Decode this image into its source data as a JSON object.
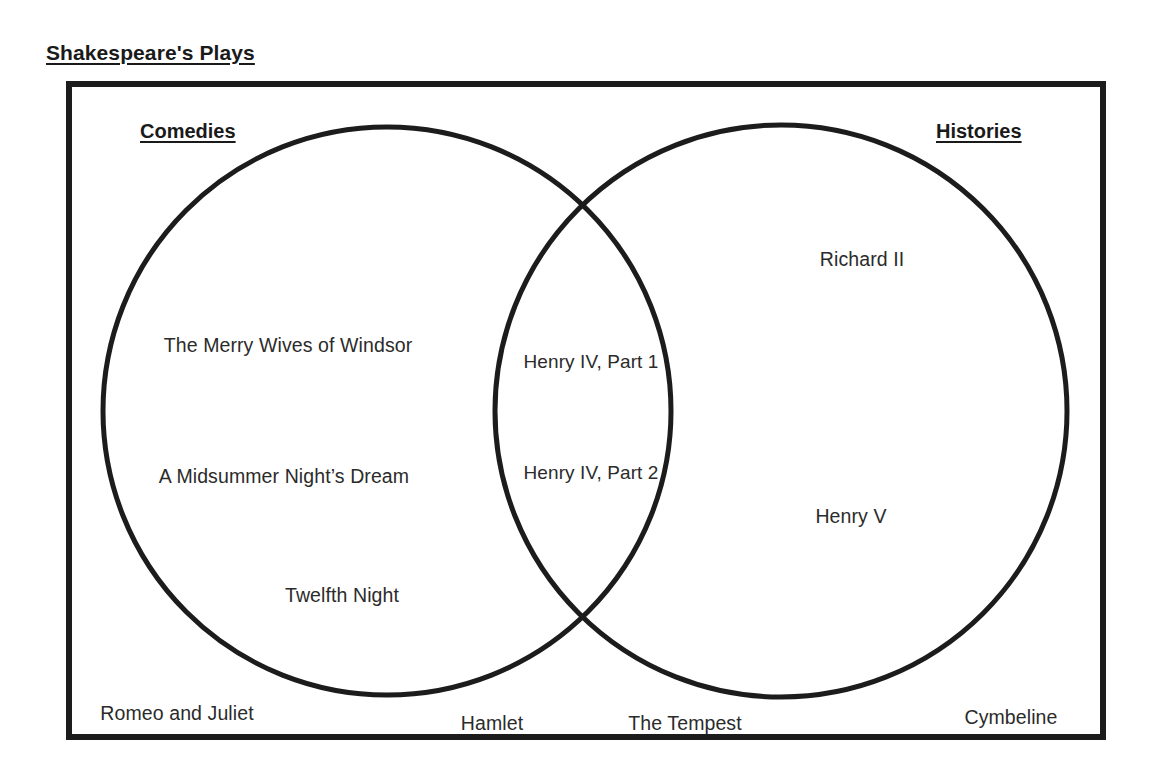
{
  "title": "Shakespeare's Plays",
  "diagram": {
    "type": "venn",
    "universe_label": "Shakespeare's Plays",
    "sets": [
      {
        "id": "comedies",
        "label": "Comedies"
      },
      {
        "id": "histories",
        "label": "Histories"
      }
    ],
    "captions": {
      "left": "Comedies",
      "right": "Histories"
    },
    "colors": {
      "stroke": "#1c1c1c",
      "text": "#2b2b2b",
      "heading": "#1a1a1a",
      "background": "#ffffff"
    },
    "regions": {
      "left_only": [
        "The Merry Wives of Windsor",
        "A Midsummer Night’s Dream",
        "Twelfth Night"
      ],
      "intersection": [
        "Henry IV, Part 1",
        "Henry IV, Part 2"
      ],
      "right_only": [
        "Richard II",
        "Henry V"
      ],
      "outside": [
        "Romeo and Juliet",
        "Hamlet",
        "The Tempest",
        "Cymbeline"
      ]
    },
    "items": [
      {
        "text": "The Merry Wives of Windsor",
        "region": "left_only",
        "x": 288,
        "y": 334
      },
      {
        "text": "A Midsummer Night’s Dream",
        "region": "left_only",
        "x": 284,
        "y": 465
      },
      {
        "text": "Twelfth Night",
        "region": "left_only",
        "x": 342,
        "y": 584
      },
      {
        "text": "Henry IV, Part 1",
        "region": "intersection",
        "x": 591,
        "y": 351
      },
      {
        "text": "Henry IV, Part 2",
        "region": "intersection",
        "x": 591,
        "y": 462
      },
      {
        "text": "Richard II",
        "region": "right_only",
        "x": 862,
        "y": 248
      },
      {
        "text": "Henry V",
        "region": "right_only",
        "x": 851,
        "y": 505
      },
      {
        "text": "Romeo and Juliet",
        "region": "outside",
        "x": 177,
        "y": 702
      },
      {
        "text": "Hamlet",
        "region": "outside",
        "x": 492,
        "y": 712
      },
      {
        "text": "The Tempest",
        "region": "outside",
        "x": 685,
        "y": 712
      },
      {
        "text": "Cymbeline",
        "region": "outside",
        "x": 1011,
        "y": 706
      }
    ],
    "geometry": {
      "box": {
        "x": 66,
        "y": 81,
        "width": 1040,
        "height": 659,
        "stroke_width": 6
      },
      "circle_left": {
        "cx": 387,
        "cy": 411,
        "r": 284,
        "stroke_width": 5
      },
      "circle_right": {
        "cx": 781,
        "cy": 411,
        "r": 286,
        "stroke_width": 5
      }
    }
  }
}
